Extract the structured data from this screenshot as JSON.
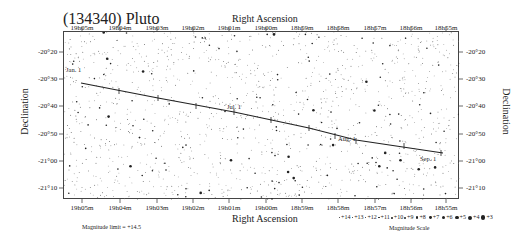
{
  "title": "(134340) Pluto",
  "chart_data": {
    "type": "line",
    "title": "(134340) Pluto",
    "subtitle": "Finder chart — path across star field",
    "xlabel": "Right Ascension",
    "ylabel": "Declination",
    "x_ticks": [
      "19h05m",
      "19h04m",
      "19h03m",
      "19h02m",
      "19h01m",
      "19h00m",
      "18h59m",
      "18h58m",
      "18h57m",
      "18h56m",
      "18h55m"
    ],
    "y_ticks": [
      "-20°20",
      "-20°30",
      "-20°40",
      "-20°50",
      "-21°00",
      "-21°10"
    ],
    "xlim": [
      "19h05.3m",
      "18h54.7m"
    ],
    "ylim": [
      "-20°17",
      "-21°14"
    ],
    "grid": false,
    "series": [
      {
        "name": "Pluto path",
        "points": [
          {
            "ra": "19h05.0m",
            "dec": "-20°29"
          },
          {
            "ra": "19h03.7m",
            "dec": "-20°33",
            "label": "Jan. 1"
          },
          {
            "ra": "19h01.0m",
            "dec": "-20°41",
            "label": "Jul. 1"
          },
          {
            "ra": "18h57.7m",
            "dec": "-20°51",
            "label": "Aug. 1"
          },
          {
            "ra": "18h55.3m",
            "dec": "-20°58",
            "label": "Sep. 1"
          }
        ]
      }
    ],
    "annotations": [
      "Jan. 1",
      "Jul. 1",
      "Aug. 1",
      "Sep. 1"
    ],
    "legend": {
      "title": "Magnitude Scale",
      "entries": [
        "+14",
        "+13",
        "+12",
        "+11",
        "+10",
        "+9",
        "+8",
        "+7",
        "+6",
        "+5",
        "+4",
        "+3"
      ],
      "position": "bottom-right"
    },
    "magnitude_limit": "Magnitude limit = +14.5"
  },
  "axes": {
    "top_title": "Right Ascension",
    "bottom_title": "Right Ascension",
    "left_title": "Declination",
    "right_title": "Declination",
    "x_ticks": [
      "19h05m",
      "19h04m",
      "19h03m",
      "19h02m",
      "19h01m",
      "19h00m",
      "18h59m",
      "18h58m",
      "18h57m",
      "18h56m",
      "18h55m"
    ],
    "y_ticks": [
      "-20°20",
      "-20°30",
      "-20°40",
      "-20°50",
      "-21°00",
      "-21°10"
    ]
  },
  "path_labels": [
    "Jan. 1",
    "Jul. 1",
    "Aug. 1",
    "Sep. 1"
  ],
  "footer": {
    "magnitude_limit": "Magnitude limit = +14.5",
    "scale_title": "Magnitude Scale",
    "scale": [
      "+14",
      "+13",
      "+12",
      "+11",
      "+10",
      "+9",
      "+8",
      "+7",
      "+6",
      "+5",
      "+4",
      "+3"
    ]
  },
  "colors": {
    "path": "#222222",
    "frame": "#444444",
    "stars": "#333333"
  }
}
